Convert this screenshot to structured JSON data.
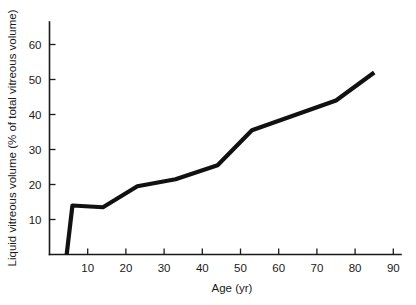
{
  "chart_data": {
    "type": "line",
    "title": "",
    "xlabel": "Age (yr)",
    "ylabel": "Liquid vitreous volume (% of total vitreous volume)",
    "xlim": [
      0,
      92
    ],
    "ylim": [
      0,
      66
    ],
    "grid": false,
    "legend": "none",
    "xticks": [
      10,
      20,
      30,
      40,
      50,
      60,
      70,
      80,
      90
    ],
    "xtick_labels": [
      "10",
      "20",
      "30",
      "40",
      "50",
      "60",
      "70",
      "80",
      "90"
    ],
    "yticks": [
      10,
      20,
      30,
      40,
      50,
      60
    ],
    "ytick_labels": [
      "10",
      "20",
      "30",
      "40",
      "50",
      "60"
    ],
    "series": [
      {
        "name": "Liquid vitreous volume",
        "color": "#111111",
        "x": [
          4.5,
          6,
          14,
          23,
          33,
          44,
          53,
          75,
          85
        ],
        "y": [
          0,
          14,
          13.5,
          19.5,
          21.5,
          25.5,
          35.5,
          44,
          52
        ]
      }
    ]
  },
  "axes": {
    "x_axis_name": "age-axis",
    "y_axis_name": "liquid-vitreous-volume-axis"
  }
}
